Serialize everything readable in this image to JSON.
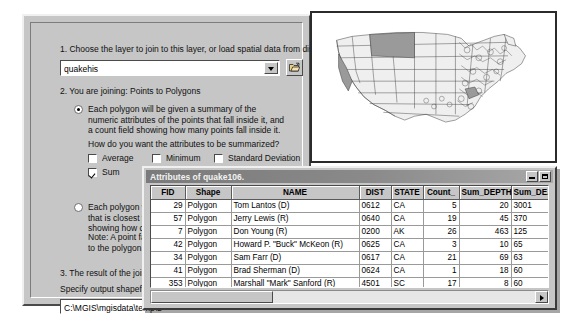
{
  "join_dialog": {
    "step1": {
      "label": "1. Choose the layer to join to this layer, or load spatial data from disk:",
      "combo_value": "quakehis",
      "combo_arrow_icon": "chevron-down-icon",
      "browse_icon": "open-folder-icon"
    },
    "step2": {
      "label": "2. You are joining:",
      "value": "Points to Polygons"
    },
    "option1": {
      "selected": true,
      "text": "Each polygon will be given a summary of the numeric attributes of the points that fall inside it, and a count field showing how many points fall inside it.",
      "summarize_question": "How do you want the attributes to be summarized?",
      "checkboxes": [
        {
          "label": "Average",
          "checked": false
        },
        {
          "label": "Minimum",
          "checked": false
        },
        {
          "label": "Standard Deviation",
          "checked": false
        },
        {
          "label": "Sum",
          "checked": true
        },
        {
          "label": "Maximum",
          "checked": false
        },
        {
          "label": "Variance",
          "checked": false
        }
      ]
    },
    "option2": {
      "selected": false,
      "text": "Each polygon will be given the attributes of the point that is closest to its boundary, and a distance field showing how close the point is (in map units).",
      "note": "Note: A point falling inside a polygon will be assigned to the polygon. (i.e. a distance of zero)"
    },
    "step3": {
      "label": "3. The result of the join will be saved into a new layer.",
      "sublabel": "Specify output shapefile or feature class for this new layer:",
      "output_path": "C:\\MGIS\\mgisdata\\temp\\d"
    }
  },
  "map_panel": {
    "name": "us-congressional-districts-map",
    "highlight_color": "#9a9a9a",
    "fill_color": "#ededed",
    "line_color": "#333333"
  },
  "attribute_table": {
    "title": "Attributes of quake106.",
    "title_buttons": [
      {
        "name": "minimize-button",
        "icon": "minimize-icon"
      },
      {
        "name": "maximize-button",
        "icon": "maximize-icon"
      }
    ],
    "columns": [
      "FID",
      "Shape",
      "NAME",
      "DIST",
      "STATE",
      "Count_",
      "Sum_DEPTH",
      "Sum_DEATH"
    ],
    "rows": [
      {
        "FID": "29",
        "Shape": "Polygon",
        "NAME": "Tom Lantos (D)",
        "DIST": "0612",
        "STATE": "CA",
        "Count_": "5",
        "Sum_DEPTH": "20",
        "Sum_DEATH": "3001"
      },
      {
        "FID": "57",
        "Shape": "Polygon",
        "NAME": "Jerry Lewis (R)",
        "DIST": "0640",
        "STATE": "CA",
        "Count_": "19",
        "Sum_DEPTH": "45",
        "Sum_DEATH": "370"
      },
      {
        "FID": "7",
        "Shape": "Polygon",
        "NAME": "Don Young (R)",
        "DIST": "0200",
        "STATE": "AK",
        "Count_": "26",
        "Sum_DEPTH": "463",
        "Sum_DEATH": "125"
      },
      {
        "FID": "42",
        "Shape": "Polygon",
        "NAME": "Howard P. \"Buck\" McKeon (R)",
        "DIST": "0625",
        "STATE": "CA",
        "Count_": "3",
        "Sum_DEPTH": "10",
        "Sum_DEATH": "65"
      },
      {
        "FID": "34",
        "Shape": "Polygon",
        "NAME": "Sam Farr (D)",
        "DIST": "0617",
        "STATE": "CA",
        "Count_": "21",
        "Sum_DEPTH": "69",
        "Sum_DEATH": "63"
      },
      {
        "FID": "41",
        "Shape": "Polygon",
        "NAME": "Brad Sherman (D)",
        "DIST": "0624",
        "STATE": "CA",
        "Count_": "1",
        "Sum_DEPTH": "18",
        "Sum_DEATH": "60"
      },
      {
        "FID": "353",
        "Shape": "Polygon",
        "NAME": "Marshall \"Mark\" Sanford (R)",
        "DIST": "4501",
        "STATE": "SC",
        "Count_": "17",
        "Sum_DEPTH": "8",
        "Sum_DEATH": "60"
      },
      {
        "FID": "232",
        "Shape": "Polygon",
        "NAME": "Rick Hill (R)",
        "DIST": "3000",
        "STATE": "MT",
        "Count_": "62",
        "Sum_DEPTH": "239",
        "Sum_DEATH": "32"
      }
    ],
    "hscroll_right_icon": "arrow-right-icon"
  }
}
